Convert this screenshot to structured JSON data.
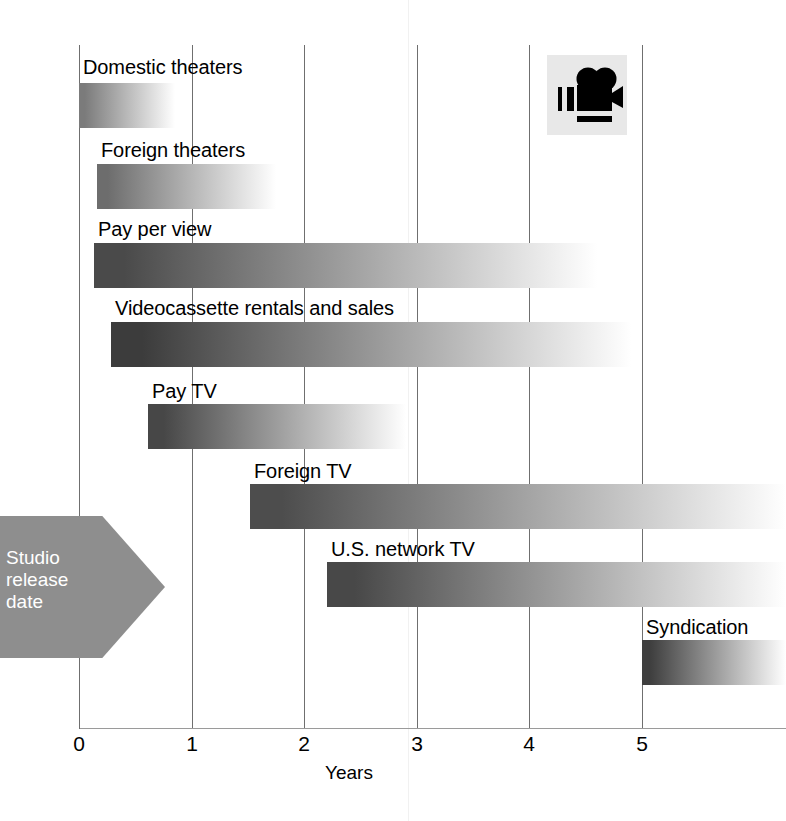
{
  "chart_data": {
    "type": "bar",
    "title": "",
    "subtitle": "",
    "xlabel": "Years",
    "ylabel": "",
    "xlim": [
      0,
      6.28
    ],
    "ylim": null,
    "grid": "vertical",
    "legend": "none",
    "orientation": "horizontal",
    "note": "Gantt-style horizontal bars showing movie release windows; each bar fades from dark at its start to white at its end.",
    "xticks": [
      "0",
      "1",
      "2",
      "3",
      "4",
      "5"
    ],
    "xtickvalues": [
      0,
      1,
      2,
      3,
      4,
      5
    ],
    "categories": [
      "Domestic theaters",
      "Foreign theaters",
      "Pay per view",
      "Videocassette rentals and sales",
      "Pay TV",
      "Foreign TV",
      "U.S. network TV",
      "Syndication"
    ],
    "bars": [
      {
        "label": "Domestic theaters",
        "start": 0.0,
        "end": 0.85,
        "start_color": "#7b7b7b",
        "end_color": "#ffffff"
      },
      {
        "label": "Foreign theaters",
        "start": 0.16,
        "end": 1.75,
        "start_color": "#6d6d6d",
        "end_color": "#ffffff"
      },
      {
        "label": "Pay per view",
        "start": 0.13,
        "end": 4.6,
        "start_color": "#4a4a4a",
        "end_color": "#ffffff"
      },
      {
        "label": "Videocassette rentals and sales",
        "start": 0.28,
        "end": 4.9,
        "start_color": "#3c3c3c",
        "end_color": "#ffffff"
      },
      {
        "label": "Pay TV",
        "start": 0.61,
        "end": 2.9,
        "start_color": "#474747",
        "end_color": "#ffffff"
      },
      {
        "label": "Foreign TV",
        "start": 1.52,
        "end": 6.28,
        "start_color": "#4d4d4d",
        "end_color": "#ffffff"
      },
      {
        "label": "U.S. network TV",
        "start": 2.2,
        "end": 6.28,
        "start_color": "#484848",
        "end_color": "#ffffff"
      },
      {
        "label": "Syndication",
        "start": 5.0,
        "end": 6.28,
        "start_color": "#3f3f3f",
        "end_color": "#ffffff"
      }
    ]
  },
  "annotations": {
    "release_arrow": {
      "lines": [
        "Studio",
        "release",
        "date"
      ],
      "text": "Studio release date",
      "color": "#8e8e8e",
      "text_color": "#ffffff"
    },
    "camera_icon_name": "movie-camera-icon"
  },
  "axis": {
    "title": "Years",
    "tick_labels": [
      "0",
      "1",
      "2",
      "3",
      "4",
      "5"
    ]
  },
  "colors": {
    "background": "#ffffff",
    "gridline": "#6f6f6f",
    "axis": "#9a9a9a",
    "text": "#000000",
    "arrow_gray": "#8e8e8e",
    "icon_panel": "#e8e8e8"
  }
}
